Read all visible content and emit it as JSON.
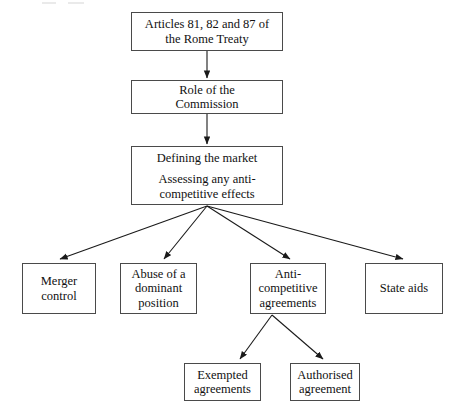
{
  "diagram": {
    "type": "flowchart",
    "nodes": [
      {
        "id": "articles",
        "name": "articles-box",
        "lines": [
          "Articles 81, 82 and 87 of",
          "the Rome Treaty"
        ],
        "x": 131,
        "y": 12,
        "w": 152,
        "h": 39
      },
      {
        "id": "commission",
        "name": "commission-box",
        "lines": [
          "Role of the",
          "Commission"
        ],
        "x": 131,
        "y": 80,
        "w": 152,
        "h": 34
      },
      {
        "id": "market",
        "name": "market-assessment-box",
        "paragraphs": [
          [
            "Defining the market"
          ],
          [
            "Assessing any anti-",
            "competitive effects"
          ]
        ],
        "x": 131,
        "y": 146,
        "w": 152,
        "h": 59
      },
      {
        "id": "merger",
        "name": "merger-control-box",
        "lines": [
          "Merger",
          "control"
        ],
        "x": 22,
        "y": 263,
        "w": 74,
        "h": 51
      },
      {
        "id": "abuse",
        "name": "abuse-dominant-position-box",
        "lines": [
          "Abuse of a",
          "dominant",
          "position"
        ],
        "x": 120,
        "y": 263,
        "w": 77,
        "h": 51
      },
      {
        "id": "anticompetitive",
        "name": "anti-competitive-agreements-box",
        "lines": [
          "Anti-",
          "competitive",
          "agreements"
        ],
        "x": 250,
        "y": 263,
        "w": 76,
        "h": 51
      },
      {
        "id": "stateaids",
        "name": "state-aids-box",
        "lines": [
          "State aids"
        ],
        "x": 365,
        "y": 263,
        "w": 78,
        "h": 51
      },
      {
        "id": "exempted",
        "name": "exempted-agreements-box",
        "lines": [
          "Exempted",
          "agreements"
        ],
        "x": 184,
        "y": 363,
        "w": 77,
        "h": 38
      },
      {
        "id": "authorised",
        "name": "authorised-agreement-box",
        "lines": [
          "Authorised",
          "agreement"
        ],
        "x": 290,
        "y": 363,
        "w": 70,
        "h": 38
      }
    ],
    "edges": [
      {
        "name": "edge-articles-to-commission",
        "from": "articles",
        "to": "commission",
        "x1": 207,
        "y1": 51,
        "x2": 207,
        "y2": 78
      },
      {
        "name": "edge-commission-to-market",
        "from": "commission",
        "to": "market",
        "x1": 207,
        "y1": 114,
        "x2": 207,
        "y2": 144
      },
      {
        "name": "edge-market-to-merger",
        "from": "market",
        "to": "merger",
        "x1": 207,
        "y1": 206,
        "x2": 60,
        "y2": 259
      },
      {
        "name": "edge-market-to-abuse",
        "from": "market",
        "to": "abuse",
        "x1": 207,
        "y1": 206,
        "x2": 164,
        "y2": 259
      },
      {
        "name": "edge-market-to-anticompetitive",
        "from": "market",
        "to": "anticompetitive",
        "x1": 207,
        "y1": 206,
        "x2": 290,
        "y2": 259
      },
      {
        "name": "edge-market-to-stateaids",
        "from": "market",
        "to": "stateaids",
        "x1": 207,
        "y1": 206,
        "x2": 403,
        "y2": 259
      },
      {
        "name": "edge-anticompetitive-to-exempted",
        "from": "anticompetitive",
        "to": "exempted",
        "x1": 272,
        "y1": 315,
        "x2": 240,
        "y2": 359
      },
      {
        "name": "edge-anticompetitive-to-authorised",
        "from": "anticompetitive",
        "to": "authorised",
        "x1": 272,
        "y1": 315,
        "x2": 323,
        "y2": 359
      }
    ],
    "colors": {
      "box_border": "#4a4a4a",
      "box_fill": "#ffffff",
      "text": "#111111",
      "edge": "#1a1a1a",
      "background": "#ffffff"
    }
  }
}
